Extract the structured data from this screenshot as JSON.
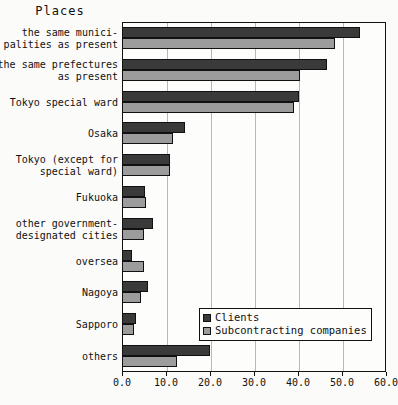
{
  "chart_data": {
    "type": "bar",
    "orientation": "horizontal",
    "title": "Places",
    "xlabel": "",
    "ylabel": "",
    "xlim": [
      0.0,
      60.0
    ],
    "xticks": [
      "0.0",
      "10.0",
      "20.0",
      "30.0",
      "40.0",
      "50.0",
      "60.0"
    ],
    "grid": true,
    "legend_position": "bottom-right",
    "categories": [
      "the same munici-\npalities as present",
      "the same prefectures\nas present",
      "Tokyo special ward",
      "Osaka",
      "Tokyo (except for\nspecial ward)",
      "Fukuoka",
      "other government-\ndesignated cities",
      "oversea",
      "Nagoya",
      "Sapporo",
      "others"
    ],
    "series": [
      {
        "name": "Clients",
        "color": "#3a3a3a",
        "values": [
          54.0,
          46.6,
          40.2,
          14.3,
          11.0,
          5.2,
          7.0,
          2.3,
          5.9,
          3.2,
          20.0
        ]
      },
      {
        "name": "Subcontracting companies",
        "color": "#9c9c9c",
        "values": [
          48.5,
          40.5,
          39.1,
          11.6,
          11.0,
          5.5,
          5.0,
          5.0,
          4.4,
          2.7,
          12.6
        ]
      }
    ]
  },
  "legend": {
    "items": [
      {
        "label": "Clients"
      },
      {
        "label": "Subcontracting companies"
      }
    ]
  }
}
